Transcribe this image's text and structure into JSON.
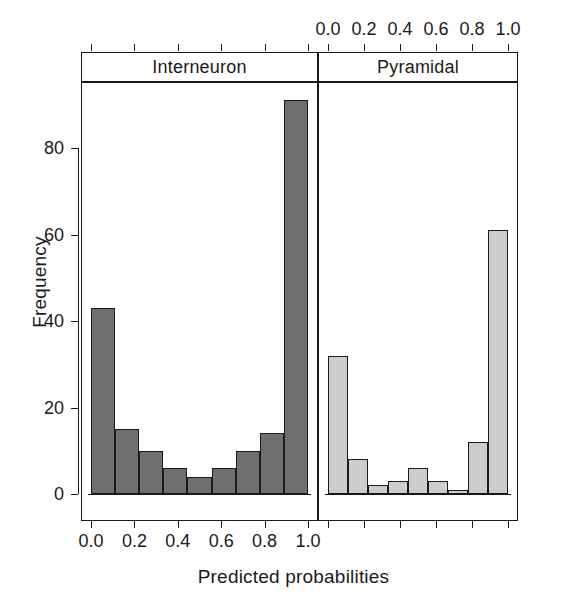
{
  "chart_data": {
    "type": "bar",
    "title": "",
    "xlabel": "Predicted probabilities",
    "ylabel": "Frequency",
    "ylim": [
      0,
      95
    ],
    "xlim": [
      0,
      1
    ],
    "grid": false,
    "legend": "none",
    "layout": "two horizontal panels, shared y-axis",
    "y_ticks": [
      "0",
      "20",
      "40",
      "60",
      "80"
    ],
    "y_tick_values": [
      0,
      20,
      40,
      60,
      80
    ],
    "x_ticks": [
      "0.0",
      "0.2",
      "0.4",
      "0.6",
      "0.8",
      "1.0"
    ],
    "x_tick_values": [
      0.0,
      0.2,
      0.4,
      0.6,
      0.8,
      1.0
    ],
    "bin_edges": [
      0.0,
      0.125,
      0.25,
      0.375,
      0.5,
      0.625,
      0.75,
      0.875,
      1.0
    ],
    "panels": [
      {
        "label": "Interneuron",
        "position": "left",
        "axis_labels_side": "bottom",
        "bar_color": "#6f6f6f",
        "bar_edge": "#1a1a1a",
        "categories": [
          "0.000",
          "0.125",
          "0.250",
          "0.375",
          "0.500",
          "0.625",
          "0.750",
          "0.875"
        ],
        "values": [
          43,
          15,
          10,
          6,
          4,
          6,
          10,
          14,
          91
        ],
        "bars": [
          {
            "x0": 0.0,
            "x1": 0.111,
            "value": 43
          },
          {
            "x0": 0.111,
            "x1": 0.222,
            "value": 15
          },
          {
            "x0": 0.222,
            "x1": 0.333,
            "value": 10
          },
          {
            "x0": 0.333,
            "x1": 0.444,
            "value": 6
          },
          {
            "x0": 0.444,
            "x1": 0.556,
            "value": 4
          },
          {
            "x0": 0.556,
            "x1": 0.667,
            "value": 6
          },
          {
            "x0": 0.667,
            "x1": 0.778,
            "value": 10
          },
          {
            "x0": 0.778,
            "x1": 0.889,
            "value": 14
          },
          {
            "x0": 0.889,
            "x1": 1.0,
            "value": 91
          }
        ]
      },
      {
        "label": "Pyramidal",
        "position": "right",
        "axis_labels_side": "top",
        "bar_color": "#cdcdcd",
        "bar_edge": "#1a1a1a",
        "categories": [
          "0.000",
          "0.125",
          "0.250",
          "0.375",
          "0.500",
          "0.625",
          "0.750",
          "0.875"
        ],
        "values": [
          32,
          8,
          2,
          3,
          6,
          3,
          1,
          12,
          61
        ],
        "bars": [
          {
            "x0": 0.0,
            "x1": 0.111,
            "value": 32
          },
          {
            "x0": 0.111,
            "x1": 0.222,
            "value": 8
          },
          {
            "x0": 0.222,
            "x1": 0.333,
            "value": 2
          },
          {
            "x0": 0.333,
            "x1": 0.444,
            "value": 3
          },
          {
            "x0": 0.444,
            "x1": 0.556,
            "value": 6
          },
          {
            "x0": 0.556,
            "x1": 0.667,
            "value": 3
          },
          {
            "x0": 0.667,
            "x1": 0.778,
            "value": 1
          },
          {
            "x0": 0.778,
            "x1": 0.889,
            "value": 12
          },
          {
            "x0": 0.889,
            "x1": 1.0,
            "value": 61
          }
        ]
      }
    ],
    "colors": {
      "axis": "#1a1a1a",
      "background": "#ffffff",
      "interneuron_fill": "#6f6f6f",
      "pyramidal_fill": "#cdcdcd"
    }
  }
}
